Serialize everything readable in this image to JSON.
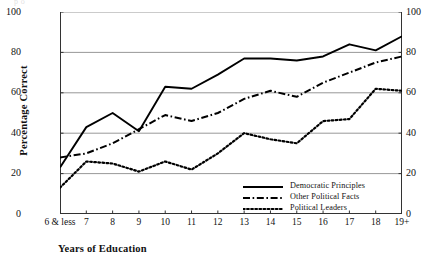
{
  "page_bleed_text": "p                                o",
  "axes": {
    "ylabel": "Percentage Correct",
    "xlabel": "Years of Education",
    "yticks": [
      "0",
      "20",
      "40",
      "60",
      "80",
      "100"
    ],
    "yticks_right": [
      "0",
      "20",
      "40",
      "60",
      "80",
      "100"
    ]
  },
  "legend": {
    "items": [
      {
        "label": "Democratic Principles",
        "style": "solid",
        "color": "#000000"
      },
      {
        "label": "Other Political Facts",
        "style": "dashdot",
        "color": "#000000"
      },
      {
        "label": "Political Leaders",
        "style": "dotted",
        "color": "#000000"
      }
    ]
  },
  "chart_data": {
    "type": "line",
    "title": "",
    "xlabel": "Years of Education",
    "ylabel": "Percentage Correct",
    "ylim": [
      0,
      100
    ],
    "ytick_step": 20,
    "grid": "horizontal",
    "dual_y_axis": true,
    "legend_position": "lower-right-inside",
    "categories": [
      "6 & less",
      "7",
      "8",
      "9",
      "10",
      "11",
      "12",
      "13",
      "14",
      "15",
      "16",
      "17",
      "18",
      "19+"
    ],
    "series": [
      {
        "name": "Democratic Principles",
        "style": "solid",
        "values": [
          23,
          43,
          50,
          41,
          63,
          62,
          69,
          77,
          77,
          76,
          78,
          84,
          81,
          88
        ]
      },
      {
        "name": "Other Political Facts",
        "style": "dashdot",
        "values": [
          28,
          30,
          35,
          42,
          49,
          46,
          50,
          57,
          61,
          58,
          65,
          70,
          75,
          78
        ]
      },
      {
        "name": "Political Leaders",
        "style": "dotted",
        "values": [
          13,
          26,
          25,
          21,
          26,
          22,
          30,
          40,
          37,
          35,
          46,
          47,
          62,
          61
        ]
      }
    ]
  }
}
